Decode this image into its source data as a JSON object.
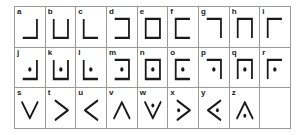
{
  "chart": {
    "type": "table",
    "rows": 3,
    "columns": 9,
    "stroke_color": "#1a1a1a",
    "grid_color": "#9a9a9a",
    "background_color": "#ffffff"
  },
  "cells": [
    {
      "label": "a",
      "shape": "corner-right-bottom",
      "dot": false
    },
    {
      "label": "b",
      "shape": "u-open-top",
      "dot": false
    },
    {
      "label": "c",
      "shape": "corner-left-bottom",
      "dot": false
    },
    {
      "label": "d",
      "shape": "u-open-left",
      "dot": false
    },
    {
      "label": "e",
      "shape": "square",
      "dot": false
    },
    {
      "label": "f",
      "shape": "u-open-right",
      "dot": false
    },
    {
      "label": "g",
      "shape": "corner-top-right",
      "dot": false
    },
    {
      "label": "h",
      "shape": "u-open-bottom",
      "dot": false
    },
    {
      "label": "i",
      "shape": "corner-top-left",
      "dot": false
    },
    {
      "label": "j",
      "shape": "corner-right-bottom",
      "dot": true
    },
    {
      "label": "k",
      "shape": "u-open-top",
      "dot": true
    },
    {
      "label": "l",
      "shape": "corner-left-bottom",
      "dot": true
    },
    {
      "label": "m",
      "shape": "u-open-left",
      "dot": true
    },
    {
      "label": "n",
      "shape": "square",
      "dot": true
    },
    {
      "label": "o",
      "shape": "u-open-right",
      "dot": true
    },
    {
      "label": "p",
      "shape": "corner-top-right",
      "dot": true
    },
    {
      "label": "q",
      "shape": "u-open-bottom",
      "dot": true
    },
    {
      "label": "r",
      "shape": "corner-top-left",
      "dot": true
    },
    {
      "label": "s",
      "shape": "chevron-down",
      "dot": false
    },
    {
      "label": "t",
      "shape": "chevron-right",
      "dot": false
    },
    {
      "label": "u",
      "shape": "chevron-left",
      "dot": false
    },
    {
      "label": "v",
      "shape": "chevron-up",
      "dot": false
    },
    {
      "label": "w",
      "shape": "chevron-down",
      "dot": true
    },
    {
      "label": "x",
      "shape": "chevron-right",
      "dot": true
    },
    {
      "label": "y",
      "shape": "chevron-left",
      "dot": true
    },
    {
      "label": "z",
      "shape": "chevron-up",
      "dot": true
    },
    {
      "label": "",
      "shape": "blank",
      "dot": false
    }
  ]
}
